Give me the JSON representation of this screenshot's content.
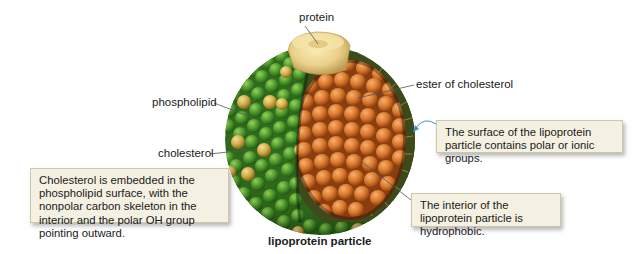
{
  "figure": {
    "caption": "lipoprotein particle",
    "labels": {
      "protein": "protein",
      "ester": "ester of cholesterol",
      "phospholipid": "phospholipid",
      "cholesterol": "cholesterol"
    },
    "callouts": {
      "cholesterol_note": "Cholesterol is embedded in the phospholipid surface, with the nonpolar carbon skeleton in the interior and the polar OH group pointing outward.",
      "surface_note": "The surface of the lipoprotein particle contains polar or ionic groups.",
      "interior_note": "The interior of the lipoprotein particle is hydrophobic."
    },
    "colors": {
      "phospholipid_green": "#4a9a2a",
      "cholesterol_yellow": "#d8b04a",
      "ester_orange": "#d9782a",
      "protein_tan": "#e9cf8a",
      "membrane_dark": "#3c4a1c",
      "callout_bg": "#f4f1e2",
      "callout_border": "#cdc7ad",
      "leader_line": "#555555",
      "arrow_blue": "#4a8fd0"
    }
  }
}
